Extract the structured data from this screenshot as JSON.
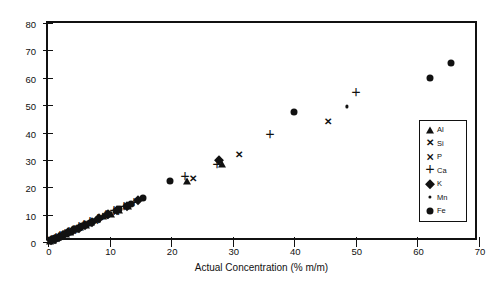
{
  "chart_data": {
    "type": "scatter",
    "title": "",
    "xlabel": "Actual Concentration (% m/m)",
    "ylabel": "Measured Concentration (%m/m)",
    "xlim": [
      0,
      70
    ],
    "ylim": [
      0,
      80
    ],
    "xticks": [
      0,
      10,
      20,
      30,
      40,
      50,
      60,
      70
    ],
    "yticks": [
      0,
      10,
      20,
      30,
      40,
      50,
      60,
      70,
      80
    ],
    "grid": false,
    "legend_position": "right-inside",
    "series": [
      {
        "name": "Al",
        "marker": "filled-triangle",
        "points": [
          [
            0.4,
            0.5
          ],
          [
            0.8,
            0.9
          ],
          [
            1.2,
            1.3
          ],
          [
            1.7,
            1.8
          ],
          [
            2.2,
            2.4
          ],
          [
            2.9,
            3.0
          ],
          [
            3.6,
            3.7
          ],
          [
            4.4,
            4.6
          ],
          [
            5.2,
            5.4
          ],
          [
            6.1,
            6.3
          ],
          [
            7.0,
            7.2
          ],
          [
            8.0,
            8.3
          ],
          [
            9.0,
            9.4
          ],
          [
            10.2,
            10.4
          ],
          [
            11.5,
            11.8
          ],
          [
            13.0,
            13.2
          ],
          [
            22.5,
            22.3
          ],
          [
            28.2,
            28.5
          ]
        ]
      },
      {
        "name": "Si",
        "marker": "x-cross",
        "points": [
          [
            0.5,
            0.6
          ],
          [
            1.0,
            1.1
          ],
          [
            1.5,
            1.6
          ],
          [
            2.1,
            2.2
          ],
          [
            2.8,
            2.9
          ],
          [
            3.5,
            3.6
          ],
          [
            4.3,
            4.4
          ],
          [
            5.1,
            5.2
          ],
          [
            6.0,
            6.1
          ],
          [
            7.2,
            7.3
          ],
          [
            8.4,
            8.6
          ],
          [
            9.6,
            9.8
          ],
          [
            11.0,
            11.2
          ],
          [
            12.6,
            12.7
          ],
          [
            23.5,
            23.0
          ],
          [
            31.0,
            31.8
          ],
          [
            45.5,
            44.0
          ]
        ]
      },
      {
        "name": "P",
        "marker": "x-with-bar",
        "points": [
          [
            0.3,
            0.4
          ],
          [
            0.7,
            0.8
          ],
          [
            1.1,
            1.2
          ],
          [
            1.6,
            1.7
          ],
          [
            2.3,
            2.4
          ],
          [
            3.1,
            3.2
          ],
          [
            4.0,
            4.1
          ],
          [
            5.0,
            5.1
          ],
          [
            6.2,
            6.4
          ],
          [
            7.6,
            7.8
          ],
          [
            9.2,
            9.4
          ],
          [
            11.0,
            11.1
          ],
          [
            12.8,
            13.0
          ]
        ]
      },
      {
        "name": "Ca",
        "marker": "plus",
        "points": [
          [
            0.6,
            0.7
          ],
          [
            1.3,
            1.4
          ],
          [
            2.0,
            2.1
          ],
          [
            2.7,
            2.9
          ],
          [
            3.4,
            3.6
          ],
          [
            4.2,
            4.4
          ],
          [
            5.0,
            5.3
          ],
          [
            5.9,
            6.2
          ],
          [
            6.9,
            7.2
          ],
          [
            8.1,
            8.5
          ],
          [
            9.4,
            9.8
          ],
          [
            10.8,
            11.2
          ],
          [
            12.3,
            12.7
          ],
          [
            14.0,
            14.4
          ],
          [
            22.2,
            23.6
          ],
          [
            27.5,
            28.0
          ],
          [
            36.0,
            39.0
          ],
          [
            50.0,
            54.5
          ]
        ]
      },
      {
        "name": "K",
        "marker": "filled-diamond",
        "points": [
          [
            0.5,
            0.6
          ],
          [
            1.1,
            1.2
          ],
          [
            1.8,
            1.9
          ],
          [
            2.5,
            2.7
          ],
          [
            3.3,
            3.5
          ],
          [
            4.1,
            4.3
          ],
          [
            5.0,
            5.2
          ],
          [
            6.0,
            6.3
          ],
          [
            7.1,
            7.4
          ],
          [
            8.3,
            8.7
          ],
          [
            9.7,
            10.1
          ],
          [
            11.2,
            11.6
          ],
          [
            12.9,
            13.3
          ],
          [
            14.6,
            15.2
          ],
          [
            27.8,
            30.0
          ]
        ]
      },
      {
        "name": "Mn",
        "marker": "small-dot",
        "points": [
          [
            0.4,
            0.4
          ],
          [
            0.9,
            1.0
          ],
          [
            1.4,
            1.5
          ],
          [
            2.0,
            2.1
          ],
          [
            2.6,
            2.8
          ],
          [
            3.4,
            3.5
          ],
          [
            4.2,
            4.4
          ],
          [
            5.1,
            5.3
          ],
          [
            6.2,
            6.4
          ],
          [
            7.5,
            7.7
          ],
          [
            9.0,
            9.2
          ],
          [
            10.8,
            11.0
          ],
          [
            12.5,
            12.8
          ],
          [
            14.4,
            15.3
          ],
          [
            48.5,
            49.5
          ]
        ]
      },
      {
        "name": "Fe",
        "marker": "filled-circle",
        "points": [
          [
            0.6,
            0.7
          ],
          [
            1.2,
            1.3
          ],
          [
            1.9,
            2.0
          ],
          [
            2.6,
            2.8
          ],
          [
            3.5,
            3.7
          ],
          [
            4.5,
            4.7
          ],
          [
            5.6,
            5.8
          ],
          [
            6.8,
            7.0
          ],
          [
            8.2,
            8.5
          ],
          [
            9.8,
            10.1
          ],
          [
            11.6,
            12.0
          ],
          [
            13.5,
            14.0
          ],
          [
            15.5,
            16.0
          ],
          [
            19.8,
            22.2
          ],
          [
            40.0,
            47.5
          ],
          [
            62.0,
            60.0
          ],
          [
            65.5,
            65.5
          ]
        ]
      }
    ]
  },
  "axes": {
    "x": {
      "label": "Actual Concentration (% m/m)",
      "tick_labels": [
        "0",
        "10",
        "20",
        "30",
        "40",
        "50",
        "60",
        "70"
      ]
    },
    "y": {
      "label": "Measured Concentration (%m/m)",
      "tick_labels": [
        "0",
        "10",
        "20",
        "30",
        "40",
        "50",
        "60",
        "70",
        "80"
      ]
    }
  },
  "legend": {
    "items": [
      {
        "label": "Al",
        "marker": "filled-triangle"
      },
      {
        "label": "Si",
        "marker": "x-cross"
      },
      {
        "label": "P",
        "marker": "x-with-bar"
      },
      {
        "label": "Ca",
        "marker": "plus"
      },
      {
        "label": "K",
        "marker": "filled-diamond"
      },
      {
        "label": "Mn",
        "marker": "small-dot"
      },
      {
        "label": "Fe",
        "marker": "filled-circle"
      }
    ]
  },
  "colors": {
    "foreground": "#111111",
    "background": "#ffffff"
  }
}
